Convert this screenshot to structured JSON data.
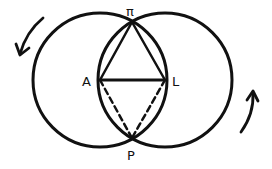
{
  "diagram": {
    "type": "geometric-construction",
    "colors": {
      "stroke": "#111111",
      "background": "#ffffff"
    },
    "circles": [
      {
        "name": "left-circle",
        "center_point": "A",
        "cx": 100,
        "cy": 80,
        "r": 67
      },
      {
        "name": "right-circle",
        "center_point": "L",
        "cx": 165,
        "cy": 80,
        "r": 67
      }
    ],
    "points": {
      "top": {
        "label": "π",
        "x": 132,
        "y": 22
      },
      "left": {
        "label": "A",
        "x": 100,
        "y": 80
      },
      "right": {
        "label": "L",
        "x": 165,
        "y": 80
      },
      "bottom": {
        "label": "P",
        "x": 132,
        "y": 138
      }
    },
    "solid_segments": [
      "A-π",
      "π-L",
      "A-L"
    ],
    "dashed_segments": [
      "A-P",
      "L-P"
    ],
    "arrows": [
      {
        "name": "rotation-arrow-left",
        "direction": "counter-clockwise",
        "position": "top-left"
      },
      {
        "name": "rotation-arrow-right",
        "direction": "counter-clockwise",
        "position": "bottom-right"
      }
    ]
  }
}
